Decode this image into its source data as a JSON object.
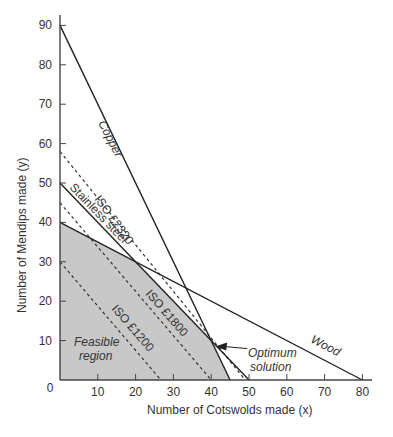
{
  "chart_data": {
    "type": "line",
    "title": "",
    "xlabel": "Number of Cotswolds made (x)",
    "ylabel": "Number of Mendips made (y)",
    "xlim": [
      0,
      83
    ],
    "ylim": [
      0,
      92
    ],
    "x_ticks": [
      0,
      10,
      20,
      30,
      40,
      50,
      60,
      70,
      80
    ],
    "y_ticks": [
      0,
      10,
      20,
      30,
      40,
      50,
      60,
      70,
      80,
      90
    ],
    "grid": false,
    "constraints": [
      {
        "name": "Copper",
        "points": [
          [
            0,
            90
          ],
          [
            45,
            0
          ]
        ],
        "style": "solid"
      },
      {
        "name": "Stainless steel",
        "points": [
          [
            0,
            50
          ],
          [
            50,
            0
          ]
        ],
        "style": "solid"
      },
      {
        "name": "Wood",
        "points": [
          [
            0,
            40
          ],
          [
            80,
            0
          ]
        ],
        "style": "solid"
      }
    ],
    "isoprofit_lines": [
      {
        "name": "ISO £1200",
        "points": [
          [
            0,
            30
          ],
          [
            26.7,
            0
          ]
        ],
        "style": "dashed"
      },
      {
        "name": "ISO £1800",
        "points": [
          [
            0,
            45
          ],
          [
            40,
            0
          ]
        ],
        "style": "dashed"
      },
      {
        "name": "ISO £2320",
        "points": [
          [
            0,
            58
          ],
          [
            49,
            0
          ]
        ],
        "style": "dashed"
      }
    ],
    "feasible_region": {
      "label": "Feasible region",
      "vertices": [
        [
          0,
          0
        ],
        [
          0,
          40
        ],
        [
          20,
          30
        ],
        [
          40,
          10
        ],
        [
          45,
          0
        ]
      ],
      "color": "#c8c8c8"
    },
    "annotations": [
      {
        "text": "Optimum solution",
        "point": [
          40,
          10
        ],
        "arrow": true
      }
    ]
  },
  "labels": {
    "copper": "Copper",
    "stainless": "Stainless steel",
    "wood": "Wood",
    "iso2320": "ISO £2320",
    "iso1800": "ISO £1800",
    "iso1200": "ISO £1200",
    "feasible_1": "Feasible",
    "feasible_2": "region",
    "optimum_1": "Optimum",
    "optimum_2": "solution",
    "xlabel": "Number of Cotswolds made (x)",
    "ylabel": "Number of Mendips made (y)"
  }
}
